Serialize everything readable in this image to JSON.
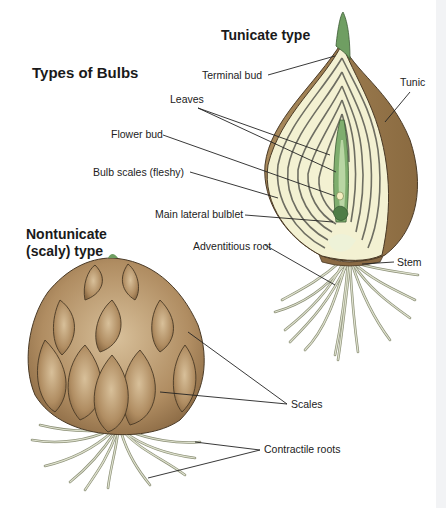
{
  "diagram": {
    "title": "Types of Bulbs",
    "tunicate": {
      "heading": "Tunicate type",
      "labels": {
        "terminal_bud": "Terminal bud",
        "tunic": "Tunic",
        "leaves": "Leaves",
        "flower_bud": "Flower bud",
        "bulb_scales": "Bulb scales (fleshy)",
        "main_lateral_bulblet": "Main lateral bulblet",
        "adventitious_root": "Adventitious root",
        "stem": "Stem"
      }
    },
    "nontunicate": {
      "heading_line1": "Nontunicate",
      "heading_line2": "(scaly) type",
      "labels": {
        "scales": "Scales",
        "contractile_roots": "Contractile roots"
      }
    },
    "colors": {
      "tunic_brown": "#9a7a4e",
      "scale_flesh": "#f3f1d2",
      "scale_lines": "#6e6e62",
      "bud_green": "#6f9e62",
      "scaly_bulb": "#b3926a",
      "root": "#c9cdb5"
    }
  }
}
